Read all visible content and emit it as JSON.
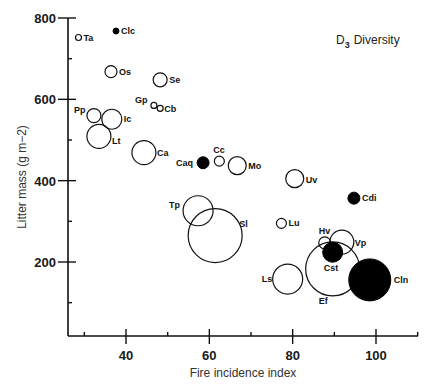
{
  "chart_data": {
    "type": "scatter",
    "subtype": "bubble",
    "title": "",
    "annotation": {
      "main": "D",
      "subscript": "3",
      "text": "Diversity"
    },
    "xlabel": "Fire incidence index",
    "ylabel": "Litter mass (g m−2)",
    "xlim": [
      26,
      110
    ],
    "ylim": [
      20,
      800
    ],
    "x_ticks": [
      {
        "value": 30,
        "label": ""
      },
      {
        "value": 40,
        "label": "40"
      },
      {
        "value": 50,
        "label": ""
      },
      {
        "value": 60,
        "label": "60"
      },
      {
        "value": 70,
        "label": ""
      },
      {
        "value": 80,
        "label": "80"
      },
      {
        "value": 90,
        "label": ""
      },
      {
        "value": 100,
        "label": "100"
      },
      {
        "value": 110,
        "label": ""
      }
    ],
    "y_ticks": [
      {
        "value": 100,
        "label": ""
      },
      {
        "value": 200,
        "label": "200"
      },
      {
        "value": 300,
        "label": ""
      },
      {
        "value": 400,
        "label": "400"
      },
      {
        "value": 500,
        "label": ""
      },
      {
        "value": 600,
        "label": "600"
      },
      {
        "value": 700,
        "label": ""
      },
      {
        "value": 800,
        "label": "800"
      }
    ],
    "grid": false,
    "legend": "none",
    "size_encoding": "diversity (D3) — bubble radius",
    "fill_encoding": "filled vs open markers",
    "points": [
      {
        "label": "Ta",
        "x": 28.6,
        "y": 752,
        "size": 3,
        "filled": false,
        "label_dx": 5,
        "label_dy": 3
      },
      {
        "label": "Clc",
        "x": 37.6,
        "y": 768,
        "size": 3,
        "filled": true,
        "label_dx": 5,
        "label_dy": 3
      },
      {
        "label": "Os",
        "x": 36.4,
        "y": 668,
        "size": 6,
        "filled": false,
        "label_dx": 8,
        "label_dy": 3
      },
      {
        "label": "Se",
        "x": 48.2,
        "y": 648,
        "size": 7,
        "filled": false,
        "label_dx": 9,
        "label_dy": 3
      },
      {
        "label": "Gp",
        "x": 46.7,
        "y": 585,
        "size": 3,
        "filled": false,
        "label_dx": -19,
        "label_dy": -2
      },
      {
        "label": "Cb",
        "x": 48.2,
        "y": 578,
        "size": 3,
        "filled": false,
        "label_dx": 4,
        "label_dy": 4
      },
      {
        "label": "Pp",
        "x": 32.3,
        "y": 560,
        "size": 7,
        "filled": false,
        "label_dx": -20,
        "label_dy": -3
      },
      {
        "label": "Ic",
        "x": 36.6,
        "y": 551,
        "size": 10,
        "filled": false,
        "label_dx": 12,
        "label_dy": 3
      },
      {
        "label": "Lt",
        "x": 33.5,
        "y": 509,
        "size": 12,
        "filled": false,
        "label_dx": 13,
        "label_dy": 8
      },
      {
        "label": "Ca",
        "x": 44.3,
        "y": 469,
        "size": 12,
        "filled": false,
        "label_dx": 13,
        "label_dy": 3
      },
      {
        "label": "Caq",
        "x": 58.5,
        "y": 444,
        "size": 6,
        "filled": true,
        "label_dx": -27,
        "label_dy": 3
      },
      {
        "label": "Cc",
        "x": 62.4,
        "y": 448,
        "size": 5,
        "filled": false,
        "label_dx": -6,
        "label_dy": -8
      },
      {
        "label": "Mo",
        "x": 66.7,
        "y": 437,
        "size": 9,
        "filled": false,
        "label_dx": 11,
        "label_dy": 3
      },
      {
        "label": "Uv",
        "x": 80.5,
        "y": 405,
        "size": 9,
        "filled": false,
        "label_dx": 11,
        "label_dy": 4
      },
      {
        "label": "Cdi",
        "x": 94.7,
        "y": 357,
        "size": 6,
        "filled": true,
        "label_dx": 8,
        "label_dy": 3
      },
      {
        "label": "Tp",
        "x": 57.3,
        "y": 326,
        "size": 15,
        "filled": false,
        "label_dx": -29,
        "label_dy": -3
      },
      {
        "label": "Sl",
        "x": 61.4,
        "y": 265,
        "size": 27,
        "filled": false,
        "label_dx": 24,
        "label_dy": -9
      },
      {
        "label": "Lu",
        "x": 77.3,
        "y": 295,
        "size": 5,
        "filled": false,
        "label_dx": 7,
        "label_dy": 3
      },
      {
        "label": "Hv",
        "x": 87.7,
        "y": 247,
        "size": 6,
        "filled": false,
        "label_dx": -6,
        "label_dy": -9
      },
      {
        "label": "Vp",
        "x": 91.8,
        "y": 249,
        "size": 12,
        "filled": false,
        "label_dx": 13,
        "label_dy": 4
      },
      {
        "label": "Ef",
        "x": 89.6,
        "y": 183,
        "size": 27,
        "filled": false,
        "label_dx": -14,
        "label_dy": 35
      },
      {
        "label": "Cst",
        "x": 89.6,
        "y": 224,
        "size": 10,
        "filled": true,
        "label_dx": -9,
        "label_dy": 19
      },
      {
        "label": "Ls",
        "x": 78.8,
        "y": 158,
        "size": 15,
        "filled": false,
        "label_dx": -26,
        "label_dy": 3
      },
      {
        "label": "Cln",
        "x": 98.5,
        "y": 156,
        "size": 21,
        "filled": true,
        "label_dx": 24,
        "label_dy": 3
      }
    ]
  }
}
